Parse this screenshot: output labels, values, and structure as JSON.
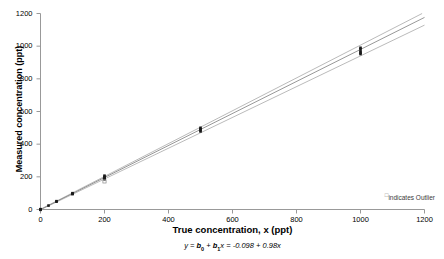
{
  "chart_data": {
    "type": "scatter",
    "title": "",
    "xlabel": "True concentration, x (ppt)",
    "ylabel": "Measured concentration (ppt)",
    "xlim": [
      0,
      1200
    ],
    "ylim": [
      0,
      1200
    ],
    "xticks": [
      0,
      200,
      400,
      600,
      800,
      1000,
      1200
    ],
    "yticks": [
      0,
      200,
      400,
      600,
      800,
      1000,
      1200
    ],
    "xtick_labels": [
      "0",
      "200",
      "400",
      "600",
      "800",
      "1000",
      "1200"
    ],
    "ytick_labels": [
      "0",
      "200",
      "400",
      "600",
      "800",
      "1000",
      "1200"
    ],
    "grid": false,
    "legend_position": "bottom-right",
    "equation": {
      "text": "y = b0 + b1x = -0.098 + 0.98x",
      "lhs": "y",
      "eq1": " = ",
      "b0": "b",
      "b0_sub": "0",
      "plus": " + ",
      "b1": "b",
      "b1_sub": "1",
      "x_var": "x",
      "eq2": " = ",
      "intercept": "-0.098",
      "slope": "0.98",
      "rhs": "-0.098 + 0.98x"
    },
    "fit": {
      "name": "Regression line",
      "intercept": -0.098,
      "slope": 0.98
    },
    "bands": [
      {
        "name": "Upper confidence band",
        "intercept": 1.5,
        "slope": 1.005
      },
      {
        "name": "Lower confidence band",
        "intercept": -1.5,
        "slope": 0.942
      }
    ],
    "series": [
      {
        "name": "Measured values",
        "marker": "filled-square",
        "points": [
          {
            "x": 0,
            "y": 0
          },
          {
            "x": 0,
            "y": 2
          },
          {
            "x": 0,
            "y": -2
          },
          {
            "x": 25,
            "y": 24
          },
          {
            "x": 50,
            "y": 48
          },
          {
            "x": 50,
            "y": 51
          },
          {
            "x": 100,
            "y": 97
          },
          {
            "x": 100,
            "y": 100
          },
          {
            "x": 100,
            "y": 94
          },
          {
            "x": 200,
            "y": 207
          },
          {
            "x": 200,
            "y": 200
          },
          {
            "x": 200,
            "y": 196
          },
          {
            "x": 200,
            "y": 190
          },
          {
            "x": 200,
            "y": 185
          },
          {
            "x": 500,
            "y": 500
          },
          {
            "x": 500,
            "y": 492
          },
          {
            "x": 500,
            "y": 485
          },
          {
            "x": 500,
            "y": 478
          },
          {
            "x": 1000,
            "y": 990
          },
          {
            "x": 1000,
            "y": 982
          },
          {
            "x": 1000,
            "y": 968
          },
          {
            "x": 1000,
            "y": 960
          },
          {
            "x": 1000,
            "y": 952
          }
        ]
      },
      {
        "name": "Outliers",
        "marker": "open-square",
        "points": [
          {
            "x": 200,
            "y": 172
          }
        ]
      }
    ],
    "legend": [
      {
        "symbol": "open-square",
        "label": "indicates Outlier"
      }
    ],
    "colors": {
      "axis": "#999999",
      "fit_line": "#8c8c8c",
      "band_line": "#a8a8a8",
      "marker": "#1a1a1a",
      "outlier": "#8a8a8a",
      "text": "#000000",
      "background": "#ffffff"
    }
  }
}
